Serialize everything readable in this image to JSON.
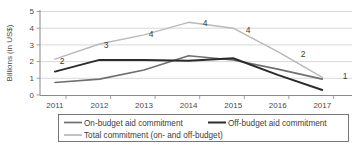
{
  "chart_data": {
    "type": "line",
    "title": "",
    "xlabel": "",
    "ylabel": "Billions (in US$)",
    "categories": [
      "2011",
      "2012",
      "2013",
      "2014",
      "2015",
      "2016",
      "2017"
    ],
    "x": [
      2011,
      2012,
      2013,
      2014,
      2015,
      2016,
      2017
    ],
    "ylim": [
      0,
      5
    ],
    "yticks": [
      0,
      1,
      2,
      3,
      4,
      5
    ],
    "ytick_labels": [
      "0",
      "1",
      "2",
      "3",
      "4",
      "5"
    ],
    "grid": true,
    "legend_position": "bottom",
    "series": [
      {
        "name": "On-budget aid commitment",
        "color": "#6f6f6f",
        "values": [
          0.75,
          0.95,
          1.5,
          2.35,
          2.1,
          1.55,
          0.95
        ]
      },
      {
        "name": "Off-budget aid commitment",
        "color": "#2b2b2b",
        "values": [
          1.4,
          2.1,
          2.1,
          2.05,
          2.2,
          1.2,
          0.3
        ]
      },
      {
        "name": "Total commitment (on- and off-budget)",
        "color": "#b9b9b9",
        "values": [
          2.15,
          3.05,
          3.6,
          4.35,
          4.0,
          2.6,
          1.05
        ],
        "data_labels": [
          "2",
          "3",
          "4",
          "4",
          "4",
          "2",
          "1"
        ]
      }
    ]
  },
  "yaxis": {
    "label": "Billions (in US$)",
    "ticks": [
      "5",
      "4",
      "3",
      "2",
      "1",
      "0"
    ]
  },
  "xaxis": {
    "ticks": [
      "2011",
      "2012",
      "2013",
      "2014",
      "2015",
      "2016",
      "2017"
    ]
  },
  "legend": {
    "entries": [
      {
        "label": "On-budget aid commitment",
        "color": "#6f6f6f"
      },
      {
        "label": "Off-budget aid commitment",
        "color": "#2b2b2b"
      },
      {
        "label": "Total commitment (on- and off-budget)",
        "color": "#b9b9b9"
      }
    ]
  },
  "data_labels": [
    "2",
    "3",
    "4",
    "4",
    "4",
    "2",
    "1"
  ]
}
